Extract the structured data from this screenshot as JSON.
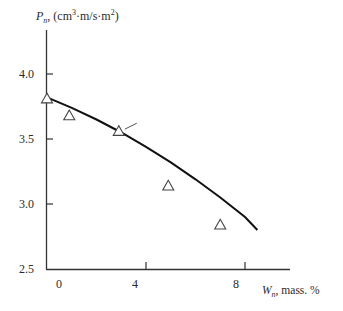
{
  "chart_data": {
    "type": "scatter",
    "title": "",
    "ylabel": "P_n, (cm³·m/s·m²)",
    "ylabel_parts": {
      "symbol": "P",
      "sub": "n",
      "unit_a": ", (cm",
      "sup1": "3",
      "unit_b": "·m/s·m",
      "sup2": "2",
      "unit_c": ")"
    },
    "xlabel": "W_n, mass. %",
    "xlabel_parts": {
      "symbol": "W",
      "sub": "n",
      "unit": ", mass. %"
    },
    "xlim": [
      0,
      9.8
    ],
    "ylim": [
      2.5,
      4.2
    ],
    "xticks": [
      0,
      4,
      8
    ],
    "xtick_labels": [
      "0",
      "4",
      "8"
    ],
    "yticks": [
      2.5,
      3.0,
      3.5,
      4.0
    ],
    "ytick_labels": [
      "2.5",
      "3.0",
      "3.5",
      "4.0"
    ],
    "grid": false,
    "legend": null,
    "series": [
      {
        "name": "experimental",
        "marker": "open-triangle",
        "x": [
          0.0,
          0.9,
          2.9,
          4.9,
          7.0
        ],
        "y": [
          3.81,
          3.68,
          3.56,
          3.14,
          2.84
        ]
      },
      {
        "name": "calculated curve",
        "style": "solid-line",
        "x": [
          0.0,
          1.0,
          2.0,
          3.0,
          4.0,
          5.0,
          6.0,
          7.0,
          8.0,
          8.5
        ],
        "y": [
          3.82,
          3.74,
          3.65,
          3.55,
          3.44,
          3.32,
          3.19,
          3.05,
          2.9,
          2.8
        ]
      }
    ],
    "annotations": [
      {
        "type": "leader-line",
        "at": [
          2.9,
          3.56
        ]
      }
    ]
  }
}
